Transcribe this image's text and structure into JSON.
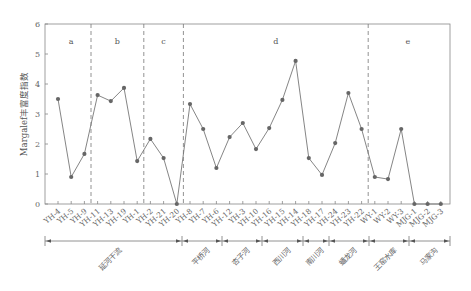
{
  "chart_data": {
    "type": "line",
    "title": "",
    "xlabel": "",
    "ylabel": "Margalef丰富度指数",
    "ylim": [
      0,
      6
    ],
    "yticks": [
      0,
      1,
      2,
      3,
      4,
      5,
      6
    ],
    "grid": false,
    "legend": null,
    "categories": [
      "YH-4",
      "YH-5",
      "YH-9",
      "YH-11",
      "YH-13",
      "YH-19",
      "YH-1",
      "YH-2",
      "YH-21",
      "YH-20",
      "YH-8",
      "YH-7",
      "YH-6",
      "YH-12",
      "YH-3",
      "YH-10",
      "YH-16",
      "YH-15",
      "YH-14",
      "YH-18",
      "YH-17",
      "YH-24",
      "YH-23",
      "YH-22",
      "WY-1",
      "WY-2",
      "WY-3",
      "MJG-1",
      "MJG-2",
      "MJG-3"
    ],
    "series": [
      {
        "name": "Margalef丰富度指数",
        "values": [
          3.5,
          0.9,
          1.67,
          3.63,
          3.43,
          3.87,
          1.43,
          2.17,
          1.53,
          0.0,
          3.33,
          2.5,
          1.2,
          2.23,
          2.7,
          1.83,
          2.53,
          3.47,
          4.77,
          1.53,
          0.97,
          2.03,
          3.7,
          2.5,
          0.9,
          0.83,
          2.5,
          0.0,
          0.0,
          0.0
        ]
      }
    ],
    "segments": [
      {
        "label": "a",
        "from": 0,
        "to": 2
      },
      {
        "label": "b",
        "from": 3,
        "to": 6
      },
      {
        "label": "c",
        "from": 7,
        "to": 9
      },
      {
        "label": "d",
        "from": 10,
        "to": 23
      },
      {
        "label": "e",
        "from": 24,
        "to": 29
      }
    ],
    "groups": [
      {
        "label": "延河干流",
        "from": 0,
        "to": 9
      },
      {
        "label": "平桥河",
        "from": 10,
        "to": 12
      },
      {
        "label": "杏子河",
        "from": 13,
        "to": 15
      },
      {
        "label": "西川河",
        "from": 16,
        "to": 18
      },
      {
        "label": "南川河",
        "from": 19,
        "to": 20
      },
      {
        "label": "蟠龙河",
        "from": 21,
        "to": 23
      },
      {
        "label": "王窑水库",
        "from": 24,
        "to": 26
      },
      {
        "label": "马家沟",
        "from": 27,
        "to": 29
      }
    ]
  }
}
